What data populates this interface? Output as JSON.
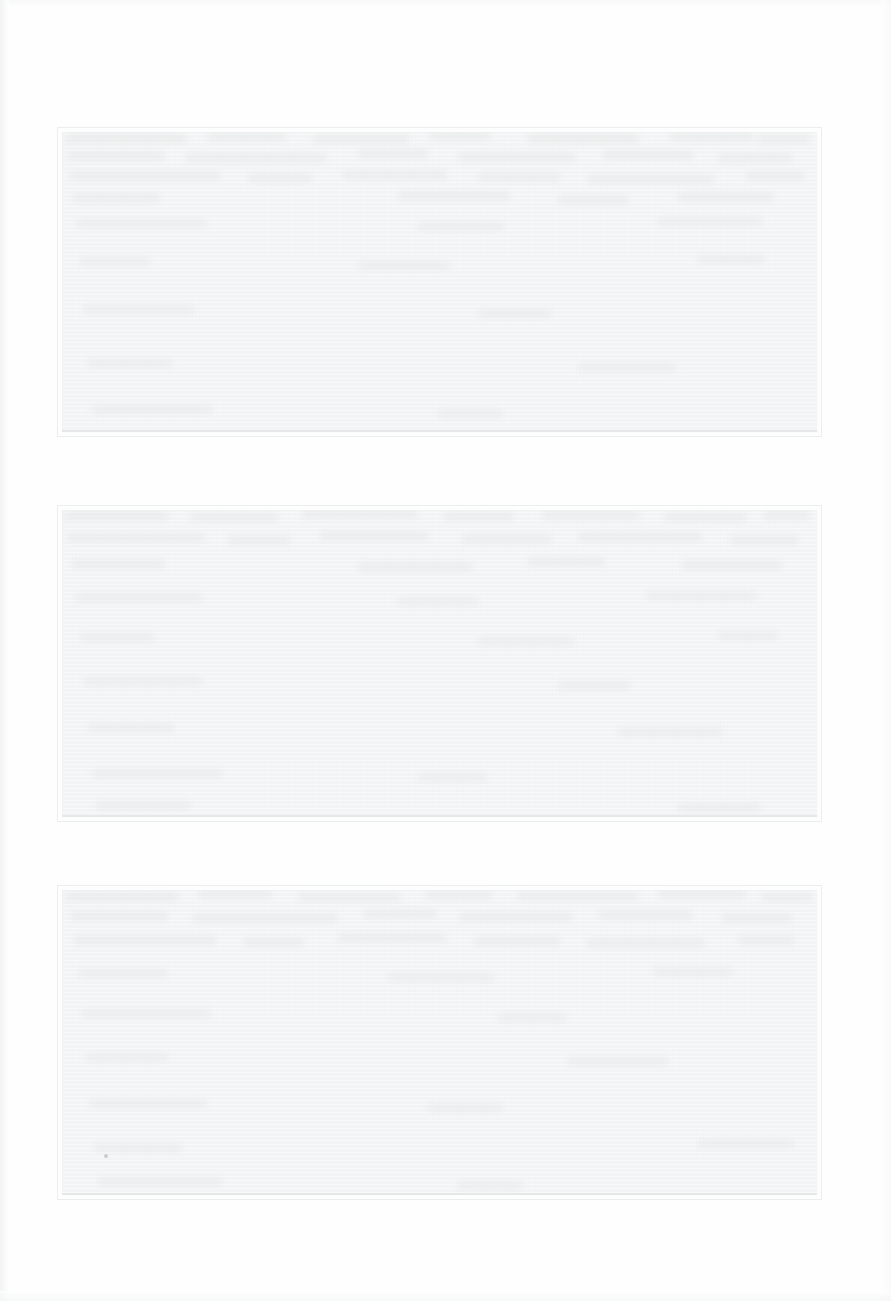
{
  "document": {
    "kind": "scanned-page",
    "page_width": 891,
    "page_height": 1301,
    "page_background": "#fefefe",
    "legible_text": "",
    "condition_note": ""
  },
  "palette": {
    "page": "#fefefe",
    "block_fill": "#f2f3f4",
    "block_border": "#eceded",
    "rule": "#e4e6e8",
    "speck": "#c9ccd0",
    "scan_edge": "#f1f2f3"
  },
  "blocks": [
    {
      "id": "block-1",
      "label": "",
      "x": 57,
      "y": 127,
      "width": 765,
      "height": 310,
      "fill": "#f2f3f4",
      "text": "",
      "ghosts": [
        {
          "x": 8,
          "y": 6,
          "w": 120,
          "h": 9
        },
        {
          "x": 150,
          "y": 5,
          "w": 78,
          "h": 8
        },
        {
          "x": 255,
          "y": 7,
          "w": 96,
          "h": 8
        },
        {
          "x": 372,
          "y": 4,
          "w": 60,
          "h": 8
        },
        {
          "x": 470,
          "y": 6,
          "w": 110,
          "h": 9
        },
        {
          "x": 612,
          "y": 5,
          "w": 84,
          "h": 8
        },
        {
          "x": 700,
          "y": 7,
          "w": 52,
          "h": 8
        },
        {
          "x": 10,
          "y": 24,
          "w": 96,
          "h": 8
        },
        {
          "x": 128,
          "y": 26,
          "w": 140,
          "h": 8
        },
        {
          "x": 300,
          "y": 22,
          "w": 70,
          "h": 8
        },
        {
          "x": 400,
          "y": 25,
          "w": 118,
          "h": 8
        },
        {
          "x": 545,
          "y": 23,
          "w": 90,
          "h": 8
        },
        {
          "x": 660,
          "y": 26,
          "w": 74,
          "h": 8
        },
        {
          "x": 12,
          "y": 44,
          "w": 150,
          "h": 8
        },
        {
          "x": 190,
          "y": 46,
          "w": 64,
          "h": 8
        },
        {
          "x": 285,
          "y": 43,
          "w": 104,
          "h": 8
        },
        {
          "x": 420,
          "y": 45,
          "w": 82,
          "h": 8
        },
        {
          "x": 530,
          "y": 47,
          "w": 126,
          "h": 8
        },
        {
          "x": 688,
          "y": 44,
          "w": 58,
          "h": 8
        },
        {
          "x": 14,
          "y": 66,
          "w": 88,
          "h": 8
        },
        {
          "x": 340,
          "y": 64,
          "w": 112,
          "h": 8
        },
        {
          "x": 500,
          "y": 68,
          "w": 70,
          "h": 8
        },
        {
          "x": 620,
          "y": 65,
          "w": 96,
          "h": 8
        },
        {
          "x": 18,
          "y": 92,
          "w": 130,
          "h": 7
        },
        {
          "x": 360,
          "y": 95,
          "w": 86,
          "h": 7
        },
        {
          "x": 600,
          "y": 90,
          "w": 104,
          "h": 7
        },
        {
          "x": 22,
          "y": 130,
          "w": 70,
          "h": 7
        },
        {
          "x": 300,
          "y": 134,
          "w": 92,
          "h": 7
        },
        {
          "x": 640,
          "y": 128,
          "w": 66,
          "h": 7
        },
        {
          "x": 26,
          "y": 178,
          "w": 110,
          "h": 7
        },
        {
          "x": 420,
          "y": 182,
          "w": 74,
          "h": 7
        },
        {
          "x": 30,
          "y": 232,
          "w": 84,
          "h": 7
        },
        {
          "x": 520,
          "y": 236,
          "w": 98,
          "h": 7
        },
        {
          "x": 34,
          "y": 278,
          "w": 120,
          "h": 7
        },
        {
          "x": 380,
          "y": 282,
          "w": 64,
          "h": 7
        }
      ]
    },
    {
      "id": "block-2",
      "label": "",
      "x": 57,
      "y": 505,
      "width": 765,
      "height": 317,
      "fill": "#f2f3f4",
      "text": "",
      "ghosts": [
        {
          "x": 6,
          "y": 5,
          "w": 104,
          "h": 9
        },
        {
          "x": 132,
          "y": 7,
          "w": 88,
          "h": 8
        },
        {
          "x": 244,
          "y": 4,
          "w": 116,
          "h": 8
        },
        {
          "x": 386,
          "y": 6,
          "w": 70,
          "h": 8
        },
        {
          "x": 484,
          "y": 5,
          "w": 98,
          "h": 8
        },
        {
          "x": 606,
          "y": 7,
          "w": 82,
          "h": 8
        },
        {
          "x": 706,
          "y": 5,
          "w": 46,
          "h": 8
        },
        {
          "x": 10,
          "y": 28,
          "w": 136,
          "h": 8
        },
        {
          "x": 170,
          "y": 30,
          "w": 62,
          "h": 8
        },
        {
          "x": 262,
          "y": 26,
          "w": 108,
          "h": 8
        },
        {
          "x": 404,
          "y": 29,
          "w": 90,
          "h": 8
        },
        {
          "x": 520,
          "y": 27,
          "w": 124,
          "h": 8
        },
        {
          "x": 672,
          "y": 30,
          "w": 68,
          "h": 8
        },
        {
          "x": 14,
          "y": 54,
          "w": 92,
          "h": 8
        },
        {
          "x": 300,
          "y": 57,
          "w": 114,
          "h": 8
        },
        {
          "x": 470,
          "y": 52,
          "w": 76,
          "h": 8
        },
        {
          "x": 624,
          "y": 55,
          "w": 100,
          "h": 8
        },
        {
          "x": 18,
          "y": 88,
          "w": 126,
          "h": 7
        },
        {
          "x": 340,
          "y": 92,
          "w": 80,
          "h": 7
        },
        {
          "x": 588,
          "y": 86,
          "w": 110,
          "h": 7
        },
        {
          "x": 22,
          "y": 128,
          "w": 74,
          "h": 7
        },
        {
          "x": 420,
          "y": 132,
          "w": 96,
          "h": 7
        },
        {
          "x": 660,
          "y": 126,
          "w": 60,
          "h": 7
        },
        {
          "x": 26,
          "y": 172,
          "w": 118,
          "h": 7
        },
        {
          "x": 500,
          "y": 176,
          "w": 72,
          "h": 7
        },
        {
          "x": 30,
          "y": 218,
          "w": 86,
          "h": 7
        },
        {
          "x": 560,
          "y": 222,
          "w": 104,
          "h": 7
        },
        {
          "x": 34,
          "y": 264,
          "w": 130,
          "h": 7
        },
        {
          "x": 360,
          "y": 268,
          "w": 68,
          "h": 7
        },
        {
          "x": 38,
          "y": 296,
          "w": 94,
          "h": 7
        },
        {
          "x": 620,
          "y": 298,
          "w": 82,
          "h": 7
        }
      ]
    },
    {
      "id": "block-3",
      "label": "",
      "x": 57,
      "y": 885,
      "width": 765,
      "height": 315,
      "fill": "#f2f3f4",
      "text": "",
      "ghosts": [
        {
          "x": 8,
          "y": 6,
          "w": 112,
          "h": 9
        },
        {
          "x": 140,
          "y": 4,
          "w": 74,
          "h": 8
        },
        {
          "x": 240,
          "y": 7,
          "w": 102,
          "h": 8
        },
        {
          "x": 368,
          "y": 5,
          "w": 66,
          "h": 8
        },
        {
          "x": 460,
          "y": 6,
          "w": 120,
          "h": 8
        },
        {
          "x": 600,
          "y": 4,
          "w": 88,
          "h": 8
        },
        {
          "x": 704,
          "y": 7,
          "w": 50,
          "h": 8
        },
        {
          "x": 12,
          "y": 26,
          "w": 98,
          "h": 8
        },
        {
          "x": 134,
          "y": 28,
          "w": 146,
          "h": 8
        },
        {
          "x": 306,
          "y": 24,
          "w": 72,
          "h": 8
        },
        {
          "x": 402,
          "y": 27,
          "w": 112,
          "h": 8
        },
        {
          "x": 540,
          "y": 25,
          "w": 94,
          "h": 8
        },
        {
          "x": 664,
          "y": 28,
          "w": 70,
          "h": 8
        },
        {
          "x": 16,
          "y": 50,
          "w": 142,
          "h": 8
        },
        {
          "x": 186,
          "y": 52,
          "w": 60,
          "h": 8
        },
        {
          "x": 280,
          "y": 48,
          "w": 108,
          "h": 8
        },
        {
          "x": 416,
          "y": 51,
          "w": 86,
          "h": 8
        },
        {
          "x": 528,
          "y": 53,
          "w": 118,
          "h": 8
        },
        {
          "x": 680,
          "y": 50,
          "w": 56,
          "h": 8
        },
        {
          "x": 20,
          "y": 84,
          "w": 90,
          "h": 7
        },
        {
          "x": 330,
          "y": 88,
          "w": 106,
          "h": 7
        },
        {
          "x": 596,
          "y": 82,
          "w": 78,
          "h": 7
        },
        {
          "x": 24,
          "y": 124,
          "w": 128,
          "h": 7
        },
        {
          "x": 440,
          "y": 128,
          "w": 68,
          "h": 7
        },
        {
          "x": 28,
          "y": 168,
          "w": 82,
          "h": 7
        },
        {
          "x": 510,
          "y": 172,
          "w": 100,
          "h": 7
        },
        {
          "x": 32,
          "y": 214,
          "w": 116,
          "h": 7
        },
        {
          "x": 370,
          "y": 218,
          "w": 74,
          "h": 7
        },
        {
          "x": 36,
          "y": 258,
          "w": 88,
          "h": 7
        },
        {
          "x": 640,
          "y": 254,
          "w": 96,
          "h": 7
        },
        {
          "x": 40,
          "y": 292,
          "w": 124,
          "h": 7
        },
        {
          "x": 400,
          "y": 296,
          "w": 64,
          "h": 7
        }
      ]
    }
  ],
  "artifacts": [
    {
      "id": "speck-1",
      "x": 104,
      "y": 1154,
      "size": 4
    }
  ]
}
